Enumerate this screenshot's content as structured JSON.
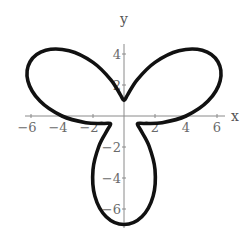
{
  "chart_data": {
    "type": "line",
    "subtype": "polar-parametric",
    "title": "",
    "equation": "r = 4 + 3 sin(3θ)",
    "xlabel": "x",
    "ylabel": "y",
    "xlim": [
      -6.5,
      6.5
    ],
    "ylim": [
      -7.2,
      4.6
    ],
    "grid": false,
    "legend": null,
    "x_ticks": [
      {
        "value": -6,
        "label": "-6"
      },
      {
        "value": -4,
        "label": "-4"
      },
      {
        "value": -2,
        "label": "-2"
      },
      {
        "value": 2,
        "label": "2"
      },
      {
        "value": 4,
        "label": "4"
      },
      {
        "value": 6,
        "label": "6"
      }
    ],
    "y_ticks": [
      {
        "value": 4,
        "label": "4"
      },
      {
        "value": 2,
        "label": "2"
      },
      {
        "value": -2,
        "label": "-2"
      },
      {
        "value": -4,
        "label": "-4"
      },
      {
        "value": -6,
        "label": "-6"
      }
    ],
    "series": [
      {
        "name": "curve",
        "color": "#111111",
        "points": [
          [
            4.0,
            0.0
          ],
          [
            5.42,
            0.96
          ],
          [
            6.2,
            2.26
          ],
          [
            6.06,
            3.5
          ],
          [
            5.05,
            4.24
          ],
          [
            3.54,
            4.21
          ],
          [
            2.0,
            3.46
          ],
          [
            0.86,
            2.35
          ],
          [
            0.24,
            1.38
          ],
          [
            0.0,
            1.0
          ],
          [
            -0.24,
            1.38
          ],
          [
            -0.86,
            2.35
          ],
          [
            -2.0,
            3.46
          ],
          [
            -3.54,
            4.21
          ],
          [
            -5.05,
            4.24
          ],
          [
            -6.06,
            3.5
          ],
          [
            -6.2,
            2.26
          ],
          [
            -5.42,
            0.96
          ],
          [
            -4.0,
            0.0
          ],
          [
            -2.46,
            -0.43
          ],
          [
            -1.32,
            -0.48
          ],
          [
            -0.87,
            -0.5
          ],
          [
            -1.07,
            -0.9
          ],
          [
            -1.61,
            -1.92
          ],
          [
            -2.0,
            -3.46
          ],
          [
            -1.88,
            -5.17
          ],
          [
            -1.15,
            -6.5
          ],
          [
            0.0,
            -7.0
          ],
          [
            1.15,
            -6.5
          ],
          [
            1.88,
            -5.17
          ],
          [
            2.0,
            -3.46
          ],
          [
            1.61,
            -1.92
          ],
          [
            1.07,
            -0.9
          ],
          [
            0.87,
            -0.5
          ],
          [
            1.32,
            -0.48
          ],
          [
            2.46,
            -0.43
          ],
          [
            4.0,
            0.0
          ]
        ]
      }
    ]
  },
  "layout": {
    "origin_px": [
      124,
      116
    ],
    "px_per_unit": 15.5,
    "x_axis_px": [
      25,
      225
    ],
    "y_axis_px": [
      44,
      228
    ]
  }
}
